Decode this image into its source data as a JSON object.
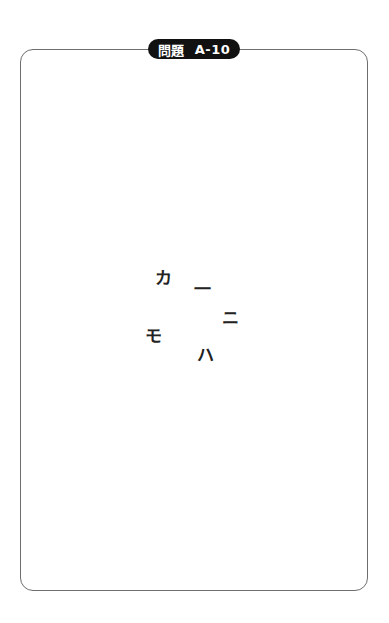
{
  "header": {
    "label_kanji": "問題",
    "label_code": "A-10"
  },
  "puzzle": {
    "characters": [
      {
        "char": "カ",
        "x": 163,
        "y": 278
      },
      {
        "char": "一",
        "x": 202,
        "y": 289
      },
      {
        "char": "ニ",
        "x": 230,
        "y": 318
      },
      {
        "char": "モ",
        "x": 153,
        "y": 336
      },
      {
        "char": "ハ",
        "x": 205,
        "y": 355
      }
    ]
  },
  "colors": {
    "frame_border": "#6e6e6e",
    "pill_background": "#111111",
    "pill_text": "#ffffff",
    "glyph_text": "#222222"
  }
}
